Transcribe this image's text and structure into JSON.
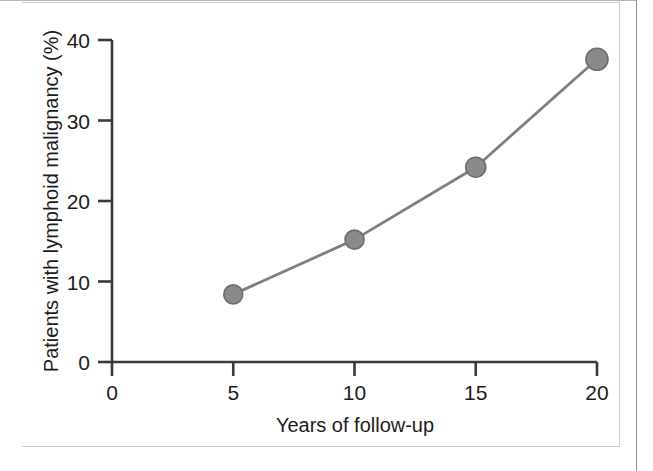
{
  "figure": {
    "kind": "line-chart",
    "background_color": "#ffffff",
    "frame": {
      "border_color": "#8e8e8e",
      "scan_line_color": "#cfcfcf"
    }
  },
  "chart_data": {
    "type": "line",
    "title": "",
    "subtitle": "",
    "xlabel": "Years of follow-up",
    "ylabel": "Patients with lymphoid malignancy (%)",
    "x": [
      5,
      10,
      15,
      20
    ],
    "values": [
      8.4,
      15.2,
      24.2,
      37.6
    ],
    "series": [
      {
        "name": "Patients with lymphoid malignancy",
        "x": [
          5,
          10,
          15,
          20
        ],
        "values": [
          8.4,
          15.2,
          24.2,
          37.6
        ],
        "line_color": "#7f7f7f",
        "marker_color": "#8a8a8a",
        "marker_edge_color": "#6d6d6d",
        "marker": "circle"
      }
    ],
    "xlim": [
      0,
      20
    ],
    "ylim": [
      0,
      40
    ],
    "xticks": [
      0,
      5,
      10,
      15,
      20
    ],
    "yticks": [
      0,
      10,
      20,
      30,
      40
    ],
    "xtick_labels": [
      "0",
      "5",
      "10",
      "15",
      "20"
    ],
    "ytick_labels": [
      "0",
      "10",
      "20",
      "30",
      "40"
    ],
    "grid": false,
    "legend": null,
    "legend_position": "none",
    "annotations": []
  },
  "axes": {
    "axis_color": "#3a3a3a",
    "tick_color": "#3a3a3a",
    "text_color": "#1c1c1c"
  }
}
